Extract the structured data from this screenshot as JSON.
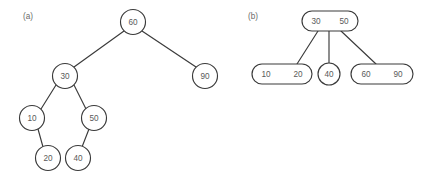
{
  "figure": {
    "background_color": "#ffffff",
    "stroke_color": "#3a3a3a",
    "label_color": "#5a5a5a",
    "caption_color": "#6a6a6a"
  },
  "panels": [
    {
      "caption": "(a)",
      "caption_x": 23,
      "caption_y": 16,
      "type": "binary-search-tree",
      "nodes": [
        {
          "id": "a-60",
          "label": "60",
          "shape": "circle",
          "cx": 133,
          "cy": 22,
          "r": 12.5
        },
        {
          "id": "a-30",
          "label": "30",
          "shape": "circle",
          "cx": 65,
          "cy": 76,
          "r": 12.5
        },
        {
          "id": "a-90",
          "label": "90",
          "shape": "circle",
          "cx": 205,
          "cy": 76,
          "r": 12.5
        },
        {
          "id": "a-10",
          "label": "10",
          "shape": "circle",
          "cx": 32,
          "cy": 118,
          "r": 12.5
        },
        {
          "id": "a-50",
          "label": "50",
          "shape": "circle",
          "cx": 94,
          "cy": 118,
          "r": 12.5
        },
        {
          "id": "a-20",
          "label": "20",
          "shape": "circle",
          "cx": 48,
          "cy": 158,
          "r": 12.5
        },
        {
          "id": "a-40",
          "label": "40",
          "shape": "circle",
          "cx": 78,
          "cy": 158,
          "r": 12.5
        }
      ],
      "edges": [
        {
          "from": "a-60",
          "to": "a-30",
          "x1": 124,
          "y1": 31,
          "x2": 74,
          "y2": 67
        },
        {
          "from": "a-60",
          "to": "a-90",
          "x1": 142,
          "y1": 31,
          "x2": 196,
          "y2": 67
        },
        {
          "from": "a-30",
          "to": "a-10",
          "x1": 56,
          "y1": 85,
          "x2": 41,
          "y2": 109
        },
        {
          "from": "a-30",
          "to": "a-50",
          "x1": 74,
          "y1": 85,
          "x2": 86,
          "y2": 109
        },
        {
          "from": "a-10",
          "to": "a-20",
          "x1": 38,
          "y1": 129,
          "x2": 43,
          "y2": 147
        },
        {
          "from": "a-50",
          "to": "a-40",
          "x1": 89,
          "y1": 129,
          "x2": 82,
          "y2": 147
        }
      ]
    },
    {
      "caption": "(b)",
      "caption_x": 248,
      "caption_y": 16,
      "type": "b-tree",
      "nodes": [
        {
          "id": "b-root",
          "shape": "rounded-rect",
          "x": 302,
          "y": 11,
          "width": 56,
          "height": 20,
          "rx": 10,
          "keys": [
            {
              "label": "30",
              "cx": 316,
              "cy": 21
            },
            {
              "label": "50",
              "cx": 344,
              "cy": 21
            }
          ]
        },
        {
          "id": "b-left",
          "shape": "rounded-rect",
          "x": 252,
          "y": 64,
          "width": 60,
          "height": 20,
          "rx": 10,
          "keys": [
            {
              "label": "10",
              "cx": 266,
              "cy": 74
            },
            {
              "label": "20",
              "cx": 298,
              "cy": 74
            }
          ]
        },
        {
          "id": "b-mid",
          "shape": "circle",
          "cx": 329,
          "cy": 74,
          "r": 11,
          "keys": [
            {
              "label": "40",
              "cx": 329,
              "cy": 74
            }
          ]
        },
        {
          "id": "b-right",
          "shape": "rounded-rect",
          "x": 351,
          "y": 64,
          "width": 62,
          "height": 20,
          "rx": 10,
          "keys": [
            {
              "label": "60",
              "cx": 366,
              "cy": 74
            },
            {
              "label": "90",
              "cx": 398,
              "cy": 74
            }
          ]
        }
      ],
      "edges": [
        {
          "from": "b-root",
          "to": "b-left",
          "x1": 318,
          "y1": 31,
          "x2": 297,
          "y2": 64
        },
        {
          "from": "b-root",
          "to": "b-mid",
          "x1": 329,
          "y1": 31,
          "x2": 329,
          "y2": 63
        },
        {
          "from": "b-root",
          "to": "b-right",
          "x1": 341,
          "y1": 31,
          "x2": 376,
          "y2": 64
        }
      ]
    }
  ]
}
